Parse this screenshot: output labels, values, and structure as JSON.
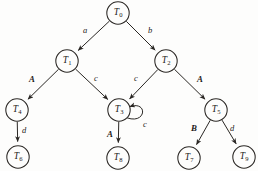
{
  "diagram": {
    "type": "directed-graph",
    "title": "",
    "canvas": {
      "width": 258,
      "height": 171
    },
    "node_radius": 11.2,
    "colors": {
      "background": "#fdfdfc",
      "stroke": "#2a2724",
      "node_fill": "#fdfdfc",
      "text": "#1d1b19"
    },
    "nodes": [
      {
        "id": "T0",
        "base": "T",
        "sub": "0",
        "x": 118,
        "y": 13
      },
      {
        "id": "T1",
        "base": "T",
        "sub": "1",
        "x": 67,
        "y": 61
      },
      {
        "id": "T2",
        "base": "T",
        "sub": "2",
        "x": 166,
        "y": 61
      },
      {
        "id": "T4",
        "base": "T",
        "sub": "4",
        "x": 17,
        "y": 110
      },
      {
        "id": "T3",
        "base": "T",
        "sub": "3",
        "x": 119,
        "y": 110
      },
      {
        "id": "T5",
        "base": "T",
        "sub": "5",
        "x": 216,
        "y": 110
      },
      {
        "id": "T6",
        "base": "T",
        "sub": "6",
        "x": 18,
        "y": 157
      },
      {
        "id": "T8",
        "base": "T",
        "sub": "8",
        "x": 118,
        "y": 158
      },
      {
        "id": "T7",
        "base": "T",
        "sub": "7",
        "x": 189,
        "y": 158
      },
      {
        "id": "T9",
        "base": "T",
        "sub": "9",
        "x": 244,
        "y": 157
      }
    ],
    "edges": [
      {
        "from": "T0",
        "to": "T1",
        "label": "a",
        "bold": false,
        "label_x": 85,
        "label_y": 30
      },
      {
        "from": "T0",
        "to": "T2",
        "label": "b",
        "bold": false,
        "label_x": 150,
        "label_y": 30
      },
      {
        "from": "T1",
        "to": "T4",
        "label": "A",
        "bold": true,
        "label_x": 32,
        "label_y": 79
      },
      {
        "from": "T1",
        "to": "T3",
        "label": "c",
        "bold": false,
        "label_x": 96,
        "label_y": 78
      },
      {
        "from": "T2",
        "to": "T3",
        "label": "c",
        "bold": false,
        "label_x": 136,
        "label_y": 78
      },
      {
        "from": "T2",
        "to": "T5",
        "label": "A",
        "bold": true,
        "label_x": 200,
        "label_y": 79
      },
      {
        "from": "T4",
        "to": "T6",
        "label": "d",
        "bold": false,
        "label_x": 24,
        "label_y": 130
      },
      {
        "from": "T3",
        "to": "T8",
        "label": "A",
        "bold": true,
        "label_x": 110,
        "label_y": 134
      },
      {
        "from": "T5",
        "to": "T7",
        "label": "B",
        "bold": true,
        "label_x": 194,
        "label_y": 128
      },
      {
        "from": "T5",
        "to": "T9",
        "label": "d",
        "bold": false,
        "label_x": 232,
        "label_y": 128
      }
    ],
    "self_loops": [
      {
        "node": "T3",
        "label": "c",
        "bold": false,
        "label_x": 145,
        "label_y": 124
      }
    ]
  }
}
